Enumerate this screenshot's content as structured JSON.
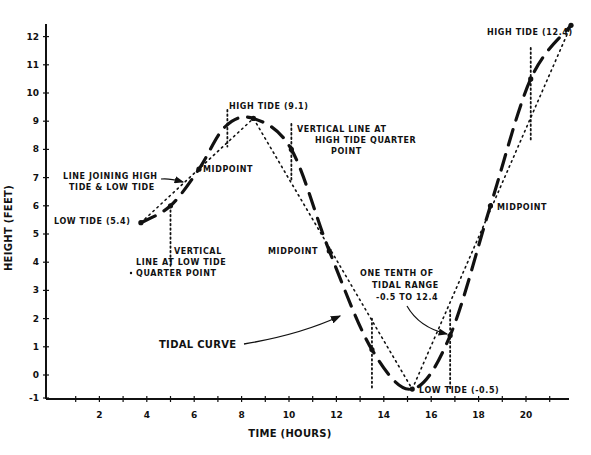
{
  "chart_data": {
    "type": "line",
    "title": "",
    "xlabel": "TIME (HOURS)",
    "ylabel": "HEIGHT (FEET)",
    "xlim": [
      0,
      22
    ],
    "ylim": [
      -1,
      12.4
    ],
    "x_ticks": [
      2,
      4,
      6,
      8,
      10,
      12,
      14,
      16,
      18,
      20
    ],
    "x_tick_labels": [
      "2",
      "4",
      "6",
      "8",
      "10",
      "12",
      "14",
      "16",
      "18",
      "20"
    ],
    "y_ticks": [
      -1,
      0,
      1,
      2,
      3,
      4,
      5,
      6,
      7,
      8,
      9,
      10,
      11,
      12
    ],
    "y_tick_labels": [
      "-1",
      "0",
      "1",
      "2",
      "3",
      "4",
      "5",
      "6",
      "7",
      "8",
      "9",
      "10",
      "11",
      "12"
    ],
    "grid": false,
    "legend": null,
    "series": [
      {
        "name": "Tidal curve",
        "style": "dashed",
        "x": [
          3.75,
          5.0,
          6.2,
          7.3,
          8.5,
          10.1,
          11.7,
          13.5,
          15.2,
          16.8,
          18.5,
          20.2,
          21.9
        ],
        "values": [
          5.4,
          6.0,
          7.3,
          8.8,
          9.1,
          8.0,
          4.4,
          0.9,
          -0.5,
          1.4,
          6.0,
          10.5,
          12.4
        ]
      },
      {
        "name": "Line joining high tide & low tide",
        "style": "dotted",
        "x": [
          3.75,
          8.5,
          15.2,
          21.9
        ],
        "values": [
          5.4,
          9.1,
          -0.5,
          12.4
        ]
      }
    ],
    "key_points": [
      {
        "label": "LOW TIDE (5.4)",
        "x": 3.75,
        "y": 5.4
      },
      {
        "label": "MIDPOINT",
        "x": 6.2,
        "y": 7.3
      },
      {
        "label": "HIGH TIDE (9.1)",
        "x": 8.5,
        "y": 9.1
      },
      {
        "label": "MIDPOINT",
        "x": 11.7,
        "y": 4.4
      },
      {
        "label": "LOW TIDE (-0.5)",
        "x": 15.2,
        "y": -0.5
      },
      {
        "label": "MIDPOINT",
        "x": 18.5,
        "y": 6.0
      },
      {
        "label": "HIGH TIDE (12.4)",
        "x": 21.9,
        "y": 12.4
      }
    ],
    "vertical_lines": [
      {
        "x": 5.0,
        "y_from": 3.8,
        "y_to": 6.0,
        "label": "VERTICAL LINE AT LOW TIDE QUARTER POINT"
      },
      {
        "x": 7.4,
        "y_from": 8.1,
        "y_to": 9.4
      },
      {
        "x": 10.1,
        "y_from": 6.9,
        "y_to": 8.9,
        "label": "VERTICAL LINE AT HIGH TIDE QUARTER POINT"
      },
      {
        "x": 13.5,
        "y_from": -0.5,
        "y_to": 2.0
      },
      {
        "x": 16.8,
        "y_from": -0.5,
        "y_to": 2.3
      },
      {
        "x": 20.2,
        "y_from": 8.3,
        "y_to": 11.6
      }
    ],
    "annotations": [
      "LINE JOINING HIGH TIDE & LOW TIDE",
      "VERTICAL LINE AT LOW TIDE QUARTER POINT",
      "VERTICAL LINE AT HIGH TIDE QUARTER POINT",
      "TIDAL CURVE",
      "ONE TENTH OF TIDAL RANGE -0.5 TO 12.4"
    ]
  },
  "labels": {
    "xlabel": "TIME (HOURS)",
    "ylabel": "HEIGHT (FEET)",
    "low_tide_1": "LOW TIDE (5.4)",
    "line_joining_1": "LINE JOINING HIGH",
    "line_joining_2": "TIDE & LOW TIDE",
    "midpoint_1": "MIDPOINT",
    "high_tide_1": "HIGH TIDE (9.1)",
    "vert_high_1": "VERTICAL LINE AT",
    "vert_high_2": "HIGH TIDE QUARTER",
    "vert_high_3": "POINT",
    "vert_low_1": "VERTICAL",
    "vert_low_2": "LINE AT LOW TIDE",
    "vert_low_3": "QUARTER POINT",
    "midpoint_2": "MIDPOINT",
    "tidal_curve": "TIDAL CURVE",
    "one_tenth_1": "ONE TENTH OF",
    "one_tenth_2": "TIDAL RANGE",
    "one_tenth_3": "-0.5 TO 12.4",
    "low_tide_2": "LOW  TIDE (-0.5)",
    "midpoint_3": "MIDPOINT",
    "high_tide_2": "HIGH TIDE (12.4)"
  }
}
